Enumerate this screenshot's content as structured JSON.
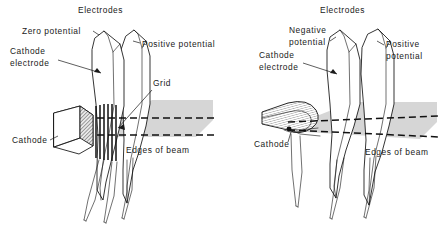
{
  "figure": {
    "background_color": "#ffffff",
    "ink_color": "#1a1a1a",
    "beam_color": "#d6d6d6"
  },
  "panels": [
    {
      "id": "left",
      "name": "unfocused-electron-gun",
      "title": "Electrodes",
      "labels": {
        "zero_potential": "Zero potential",
        "cathode_electrode_line1": "Cathode",
        "cathode_electrode_line2": "electrode",
        "positive_potential": "Positive potential",
        "grid": "Grid",
        "cathode": "Cathode",
        "edges_of_beam": "Edges of beam"
      }
    },
    {
      "id": "right",
      "name": "focused-electron-gun",
      "title": "Electrodes",
      "labels": {
        "negative_potential_line1": "Negative",
        "negative_potential_line2": "potential",
        "cathode_electrode_line1": "Cathode",
        "cathode_electrode_line2": "electrode",
        "positive_potential_line1": "Positive",
        "positive_potential_line2": "potential",
        "cathode": "Cathode",
        "edges_of_beam": "Edges of beam"
      }
    }
  ]
}
